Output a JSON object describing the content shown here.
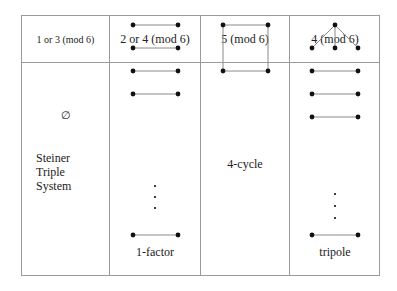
{
  "table": {
    "columns": [
      {
        "header": "1 or 3 (mod 6)",
        "symbol": "∅",
        "caption_lines": [
          "Steiner",
          "Triple",
          "System"
        ]
      },
      {
        "header": "2 or 4 (mod 6)",
        "caption": "1-factor"
      },
      {
        "header": "5 (mod 6)",
        "caption": "4-cycle"
      },
      {
        "header": "4 (mod 6)",
        "caption": "tripole"
      }
    ]
  },
  "colors": {
    "border": "#9a9a9a",
    "edge": "#8a8a8a",
    "vertex": "#111111",
    "text": "#222222"
  }
}
